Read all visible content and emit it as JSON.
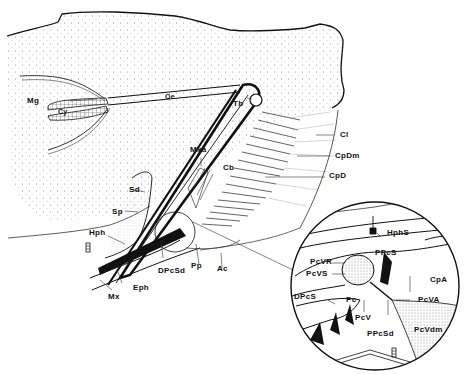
{
  "figure": {
    "type": "anatomical line drawing",
    "colors": {
      "ink": "#111111",
      "stipple": "#9a9a9a",
      "background": "#ffffff"
    },
    "main_view": {
      "labels": [
        {
          "id": "Mg",
          "text": "Mg"
        },
        {
          "id": "Cy",
          "text": "Cy"
        },
        {
          "id": "Oe",
          "text": "Oe"
        },
        {
          "id": "Tb",
          "text": "Tb"
        },
        {
          "id": "Cl",
          "text": "Cl"
        },
        {
          "id": "CpDm",
          "text": "CpDm"
        },
        {
          "id": "CpD",
          "text": "CpD"
        },
        {
          "id": "Mxa",
          "text": "Mxa"
        },
        {
          "id": "Cb",
          "text": "Cb"
        },
        {
          "id": "Sd",
          "text": "Sd"
        },
        {
          "id": "Sp",
          "text": "Sp"
        },
        {
          "id": "Hph",
          "text": "Hph"
        },
        {
          "id": "DPcSd",
          "text": "DPcSd"
        },
        {
          "id": "Pp",
          "text": "Pp"
        },
        {
          "id": "Ac",
          "text": "Ac"
        },
        {
          "id": "Eph",
          "text": "Eph"
        },
        {
          "id": "Mx",
          "text": "Mx"
        }
      ],
      "scale_mark": "scale-bar-icon"
    },
    "inset_view": {
      "shape": "circle",
      "labels": [
        {
          "id": "HphS",
          "text": "HphS"
        },
        {
          "id": "PPcS",
          "text": "PPcS"
        },
        {
          "id": "PcVR",
          "text": "PcVR"
        },
        {
          "id": "PcVS",
          "text": "PcVS"
        },
        {
          "id": "CpA",
          "text": "CpA"
        },
        {
          "id": "DPcS",
          "text": "DPcS"
        },
        {
          "id": "Pc",
          "text": "Pc"
        },
        {
          "id": "PcVA",
          "text": "PcVA"
        },
        {
          "id": "PcV",
          "text": "PcV"
        },
        {
          "id": "PPcSd",
          "text": "PPcSd"
        },
        {
          "id": "PcVdm",
          "text": "PcVdm"
        }
      ],
      "scale_mark": "scale-bar-icon"
    }
  }
}
